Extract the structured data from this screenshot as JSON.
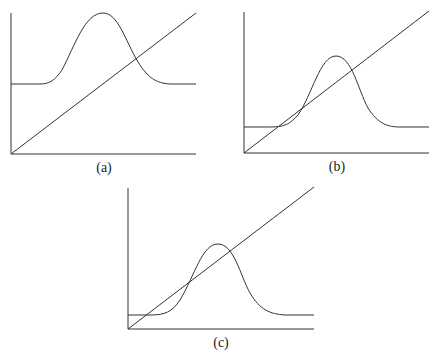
{
  "panels": [
    {
      "id": "a",
      "label": "(a)",
      "description": "Gaussian bump above baseline intersecting diagonal line once on the descending side"
    },
    {
      "id": "b",
      "label": "(b)",
      "description": "Lower gaussian bump tangent to diagonal line at left and intersecting on descending side"
    },
    {
      "id": "c",
      "label": "(c)",
      "description": "Gaussian bump intersecting diagonal line at three points"
    }
  ],
  "colors": {
    "line": "#333333",
    "background": "#ffffff"
  }
}
